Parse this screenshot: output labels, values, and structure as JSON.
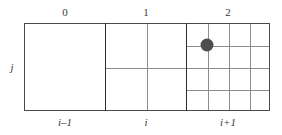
{
  "figure": {
    "background_color": "#ffffff",
    "frame_color": "#4a4a4a",
    "gridline_color": "#8d8d8d",
    "separator_color": "#2e2e2e",
    "marker_color": "#4d4d4d"
  },
  "level_labels": [
    {
      "text": "0",
      "center_x": 65
    },
    {
      "text": "1",
      "center_x": 146
    },
    {
      "text": "2",
      "center_x": 228
    }
  ],
  "index_labels": [
    {
      "text": "i–1",
      "center_x": 65
    },
    {
      "text": "i",
      "center_x": 146
    },
    {
      "text": "i+1",
      "center_x": 228
    }
  ],
  "row_label": {
    "text": "j"
  },
  "blocks": [
    {
      "name": "level-0-block",
      "level": "0",
      "index": "i–1",
      "divisions": 1,
      "left": 24,
      "top": 23,
      "width": 82,
      "height": 88,
      "v_fractions": [],
      "h_fractions": []
    },
    {
      "name": "level-1-block",
      "level": "1",
      "index": "i",
      "divisions": 2,
      "left": 105,
      "top": 23,
      "width": 82,
      "height": 88,
      "v_fractions": [
        0.5
      ],
      "h_fractions": [
        0.5
      ]
    },
    {
      "name": "level-2-block",
      "level": "2",
      "index": "i+1",
      "divisions": 4,
      "left": 186,
      "top": 23,
      "width": 84,
      "height": 88,
      "v_fractions": [
        0.25,
        0.5,
        0.75
      ],
      "h_fractions": [
        0.25,
        0.5,
        0.75
      ]
    }
  ],
  "separators": [
    {
      "name": "separator-level-0-1",
      "x": 105,
      "top": 23,
      "height": 88
    },
    {
      "name": "separator-level-1-2",
      "x": 186,
      "top": 23,
      "height": 88
    }
  ],
  "marker": {
    "name": "grid-node-marker",
    "center_x": 207,
    "center_y": 45,
    "diameter": 13
  }
}
